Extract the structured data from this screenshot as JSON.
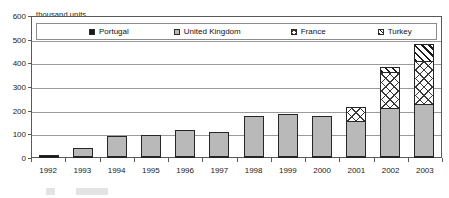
{
  "chart_data": {
    "type": "bar",
    "stacked": true,
    "title": "",
    "subtitle": "",
    "xlabel": "",
    "ylabel": "thousand units",
    "ylim": [
      0,
      600
    ],
    "ytick_values": [
      600,
      500,
      400,
      300,
      200,
      100,
      0
    ],
    "grid": true,
    "legend_position": "top-inside",
    "categories": [
      "1992",
      "1993",
      "1994",
      "1995",
      "1996",
      "1997",
      "1998",
      "1999",
      "2000",
      "2001",
      "2002",
      "2003"
    ],
    "series": [
      {
        "name": "Portugal",
        "values": [
          12,
          8,
          8,
          6,
          6,
          6,
          6,
          6,
          6,
          7,
          7,
          7
        ]
      },
      {
        "name": "United Kingdom",
        "values": [
          0,
          40,
          88,
          91,
          115,
          104,
          173,
          180,
          172,
          153,
          208,
          226
        ]
      },
      {
        "name": "France",
        "values": [
          0,
          0,
          0,
          0,
          0,
          0,
          0,
          0,
          0,
          62,
          155,
          182
        ]
      },
      {
        "name": "Turkey",
        "values": [
          0,
          0,
          0,
          0,
          0,
          0,
          0,
          0,
          0,
          0,
          25,
          80
        ]
      }
    ],
    "totals": [
      12,
      48,
      96,
      97,
      121,
      110,
      179,
      186,
      178,
      222,
      395,
      495
    ],
    "colors": {
      "Portugal": "#1a1a1a",
      "United Kingdom": "#b9b9b9",
      "France": "#ffffff",
      "Turkey": "#ffffff"
    },
    "patterns": {
      "Portugal": "solid-black",
      "United Kingdom": "solid-gray",
      "France": "cross-hatch",
      "Turkey": "diagonal-stripes"
    }
  },
  "axis": {
    "unit_label": "thousand units",
    "y_ticks": [
      "600",
      "500",
      "400",
      "300",
      "200",
      "100",
      "0"
    ],
    "x_ticks": [
      "1992",
      "1993",
      "1994",
      "1995",
      "1996",
      "1997",
      "1998",
      "1999",
      "2000",
      "2001",
      "2002",
      "2003"
    ]
  },
  "legend": {
    "items": [
      {
        "label": "Portugal",
        "swatch": "solid-black-swatch"
      },
      {
        "label": "United Kingdom",
        "swatch": "solid-gray-swatch"
      },
      {
        "label": "France",
        "swatch": "cross-hatch-swatch"
      },
      {
        "label": "Turkey",
        "swatch": "diagonal-stripe-swatch"
      }
    ]
  }
}
